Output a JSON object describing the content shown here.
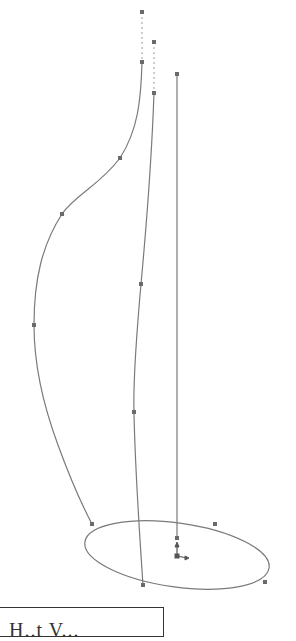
{
  "diagram": {
    "type": "cad-sketch",
    "stroke_color": "#7a7a7a",
    "point_color": "#6a6a6a",
    "curves": [
      {
        "name": "left-guide-curve",
        "points": [
          [
            142,
            62
          ],
          [
            135,
            120
          ],
          [
            120,
            158
          ],
          [
            62,
            214
          ],
          [
            34,
            325
          ],
          [
            50,
            425
          ],
          [
            92,
            524
          ]
        ]
      },
      {
        "name": "middle-guide-curve",
        "points": [
          [
            154,
            93
          ],
          [
            149,
            180
          ],
          [
            141,
            284
          ],
          [
            134,
            412
          ],
          [
            143,
            585
          ]
        ]
      },
      {
        "name": "right-guide-line",
        "points": [
          [
            177,
            74
          ],
          [
            177,
            540
          ]
        ]
      }
    ],
    "construction_lines": [
      {
        "name": "left-extension",
        "from": [
          142,
          12
        ],
        "to": [
          142,
          62
        ]
      },
      {
        "name": "middle-extension",
        "from": [
          154,
          42
        ],
        "to": [
          154,
          93
        ]
      }
    ],
    "ellipse": {
      "cx": 177,
      "cy": 555,
      "rx": 93,
      "ry": 32,
      "rotation": 8
    },
    "control_points": [
      [
        142,
        12
      ],
      [
        154,
        42
      ],
      [
        142,
        62
      ],
      [
        154,
        93
      ],
      [
        177,
        74
      ],
      [
        120,
        158
      ],
      [
        62,
        214
      ],
      [
        34,
        325
      ],
      [
        141,
        284
      ],
      [
        134,
        412
      ],
      [
        92,
        524
      ],
      [
        143,
        585
      ],
      [
        215,
        524
      ],
      [
        265,
        582
      ],
      [
        177,
        538
      ]
    ],
    "origin": {
      "x": 177,
      "y": 556
    }
  },
  "label": {
    "text": "H..t V..."
  }
}
